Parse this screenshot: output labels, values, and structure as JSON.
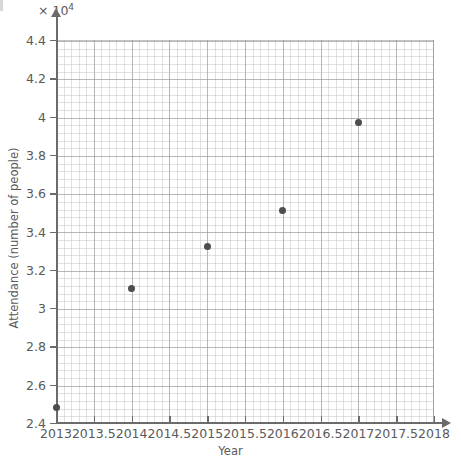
{
  "chart_data": {
    "type": "scatter",
    "title": "",
    "xlabel": "Year",
    "ylabel": "Attendance (number of people)",
    "y_multiplier_label": "× 10",
    "y_multiplier_exponent": "4",
    "y_scale": 10000,
    "xlim": [
      2013,
      2018
    ],
    "ylim": [
      2.4,
      4.4
    ],
    "grid": true,
    "minor_grid": true,
    "legend": "none",
    "x_ticks": [
      "2013",
      "2013.5",
      "2014",
      "2014.5",
      "2015",
      "2015.5",
      "2016",
      "2016.5",
      "2017",
      "2017.5",
      "2018"
    ],
    "x_tick_values": [
      2013,
      2013.5,
      2014,
      2014.5,
      2015,
      2015.5,
      2016,
      2016.5,
      2017,
      2017.5,
      2018
    ],
    "y_ticks": [
      "2.4",
      "2.6",
      "2.8",
      "3",
      "3.2",
      "3.4",
      "3.6",
      "3.8",
      "4",
      "4.2",
      "4.4"
    ],
    "y_tick_values": [
      2.4,
      2.6,
      2.8,
      3,
      3.2,
      3.4,
      3.6,
      3.8,
      4,
      4.2,
      4.4
    ],
    "x": [
      2013,
      2014,
      2015,
      2016,
      2017
    ],
    "y": [
      2.48,
      3.1,
      3.32,
      3.51,
      3.97
    ],
    "points": [
      {
        "x": 2013,
        "y": 2.48,
        "attendance": 24800
      },
      {
        "x": 2014,
        "y": 3.1,
        "attendance": 31000
      },
      {
        "x": 2015,
        "y": 3.32,
        "attendance": 33200
      },
      {
        "x": 2016,
        "y": 3.51,
        "attendance": 35100
      },
      {
        "x": 2017,
        "y": 3.97,
        "attendance": 39700
      }
    ],
    "marker_color": "#4d4d4d",
    "grid_color": "#b4b4b4",
    "axis_color": "#6b6b6b",
    "text_color": "#5a5a5a"
  }
}
